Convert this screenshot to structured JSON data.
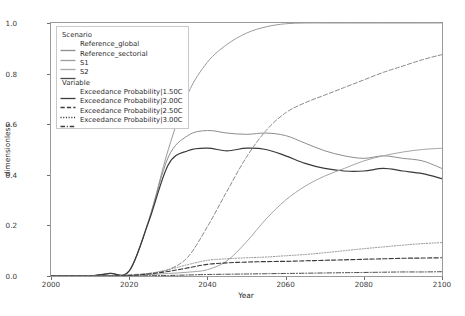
{
  "chart_data": {
    "type": "line",
    "title": "",
    "xlabel": "Year",
    "ylabel": "dimensionless",
    "xlim": [
      2000,
      2100
    ],
    "ylim": [
      0.0,
      1.0
    ],
    "xticks": [
      2000,
      2020,
      2040,
      2060,
      2080,
      2100
    ],
    "yticks": [
      0.0,
      0.2,
      0.4,
      0.6,
      0.8,
      1.0
    ],
    "xtick_labels": [
      "2000",
      "2020",
      "2040",
      "2060",
      "2080",
      "2100"
    ],
    "ytick_labels": [
      "0.0",
      "0.2",
      "0.4",
      "0.6",
      "0.8",
      "1.0"
    ],
    "grid": false,
    "legend_position": "upper left",
    "legend_groups": [
      {
        "title": "Scenario",
        "entries": [
          {
            "label": "Reference_global",
            "color": "#8f8f8f",
            "dash": "solid"
          },
          {
            "label": "Reference_sectorial",
            "color": "#9c9c9c",
            "dash": "solid"
          },
          {
            "label": "S1",
            "color": "#a8a8a8",
            "dash": "solid"
          },
          {
            "label": "S2",
            "color": "#4a4a4a",
            "dash": "solid"
          }
        ]
      },
      {
        "title": "Variable",
        "entries": [
          {
            "label": "Exceedance Probability|1.50C",
            "color": "#3c3c3c",
            "dash": "solid"
          },
          {
            "label": "Exceedance Probability|2.00C",
            "color": "#3c3c3c",
            "dash": "dashed"
          },
          {
            "label": "Exceedance Probability|2.50C",
            "color": "#3c3c3c",
            "dash": "dotted"
          },
          {
            "label": "Exceedance Probability|3.00C",
            "color": "#3c3c3c",
            "dash": "dashdot"
          }
        ]
      }
    ],
    "x": [
      2000,
      2005,
      2010,
      2015,
      2020,
      2025,
      2030,
      2035,
      2040,
      2045,
      2050,
      2055,
      2060,
      2065,
      2070,
      2075,
      2080,
      2085,
      2090,
      2095,
      2100
    ],
    "series": [
      {
        "name": "Exceedance Probability|1.50C",
        "scenario": "S2",
        "variable": "Exceedance Probability|1.50C",
        "color": "#9a9a9a",
        "dash": "solid",
        "width": 1.0,
        "values": [
          0.0,
          0.0,
          0.0,
          0.01,
          0.02,
          0.22,
          0.5,
          0.72,
          0.845,
          0.915,
          0.96,
          0.985,
          0.997,
          1.0,
          1.0,
          1.0,
          1.0,
          1.0,
          1.0,
          1.0,
          1.0
        ]
      },
      {
        "name": "Exceedance Probability|1.50C",
        "scenario": "Reference_global",
        "variable": "Exceedance Probability|1.50C",
        "color": "#8d8d8d",
        "dash": "solid",
        "width": 1.0,
        "values": [
          0.0,
          0.0,
          0.0,
          0.01,
          0.02,
          0.22,
          0.47,
          0.555,
          0.575,
          0.565,
          0.56,
          0.565,
          0.555,
          0.525,
          0.495,
          0.475,
          0.465,
          0.475,
          0.465,
          0.455,
          0.425
        ]
      },
      {
        "name": "Exceedance Probability|1.50C",
        "scenario": "Reference_sectorial",
        "variable": "Exceedance Probability|1.50C",
        "color": "#3a3a3a",
        "dash": "solid",
        "width": 1.25,
        "values": [
          0.0,
          0.0,
          0.0,
          0.01,
          0.02,
          0.215,
          0.44,
          0.495,
          0.505,
          0.495,
          0.505,
          0.5,
          0.475,
          0.445,
          0.425,
          0.415,
          0.415,
          0.425,
          0.415,
          0.405,
          0.385
        ]
      },
      {
        "name": "Exceedance Probability|2.00C",
        "scenario": "S2",
        "variable": "Exceedance Probability|2.00C",
        "color": "#8a8a8a",
        "dash": "dashed",
        "width": 1.0,
        "values": [
          0.0,
          0.0,
          0.0,
          0.0,
          0.005,
          0.01,
          0.025,
          0.075,
          0.195,
          0.335,
          0.47,
          0.575,
          0.645,
          0.685,
          0.715,
          0.745,
          0.775,
          0.805,
          0.83,
          0.855,
          0.875
        ]
      },
      {
        "name": "Exceedance Probability|2.00C",
        "scenario": "S1",
        "variable": "Exceedance Probability|2.00C",
        "color": "#a5a5a5",
        "dash": "solid",
        "width": 1.0,
        "values": [
          0.0,
          0.0,
          0.0,
          0.0,
          0.002,
          0.005,
          0.01,
          0.015,
          0.025,
          0.06,
          0.135,
          0.225,
          0.3,
          0.355,
          0.395,
          0.425,
          0.455,
          0.475,
          0.49,
          0.5,
          0.505
        ]
      },
      {
        "name": "Exceedance Probability|2.50C",
        "scenario": "Reference_global",
        "variable": "Exceedance Probability|2.50C",
        "color": "#8f8f8f",
        "dash": "dotted",
        "width": 1.0,
        "values": [
          0.0,
          0.0,
          0.0,
          0.0,
          0.002,
          0.01,
          0.025,
          0.045,
          0.062,
          0.068,
          0.072,
          0.075,
          0.08,
          0.085,
          0.092,
          0.1,
          0.108,
          0.115,
          0.122,
          0.128,
          0.132
        ]
      },
      {
        "name": "Exceedance Probability|2.50C",
        "scenario": "Reference_sectorial",
        "variable": "Exceedance Probability|2.50C",
        "color": "#3c3c3c",
        "dash": "dashed",
        "width": 1.15,
        "values": [
          0.0,
          0.0,
          0.0,
          0.0,
          0.002,
          0.008,
          0.018,
          0.032,
          0.046,
          0.052,
          0.055,
          0.057,
          0.058,
          0.06,
          0.062,
          0.064,
          0.066,
          0.068,
          0.07,
          0.071,
          0.072
        ]
      },
      {
        "name": "Exceedance Probability|3.00C",
        "scenario": "S1",
        "variable": "Exceedance Probability|3.00C",
        "color": "#4a4a4a",
        "dash": "dashdot",
        "width": 1.0,
        "values": [
          0.0,
          0.0,
          0.0,
          0.0,
          0.0,
          0.001,
          0.002,
          0.004,
          0.006,
          0.007,
          0.008,
          0.009,
          0.01,
          0.011,
          0.012,
          0.013,
          0.014,
          0.015,
          0.016,
          0.016,
          0.017
        ]
      }
    ]
  }
}
